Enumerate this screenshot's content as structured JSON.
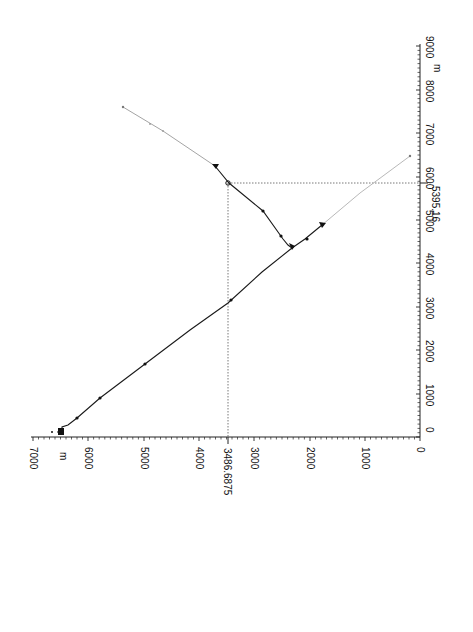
{
  "chart_data": {
    "type": "line",
    "title": "",
    "orientation": "rotated 90° (page in landscape); horizontal axis at bottom shows Y values decreasing left→right, vertical axis at right shows X values increasing upward",
    "xlabel": "m",
    "ylabel": "m",
    "xlim": [
      0,
      9000
    ],
    "ylim": [
      0,
      7000
    ],
    "x_ticks": [
      0,
      1000,
      2000,
      3000,
      4000,
      5000,
      6000,
      7000,
      8000,
      9000
    ],
    "y_ticks": [
      0,
      1000,
      2000,
      3000,
      4000,
      5000,
      6000,
      7000
    ],
    "x_unit_label": "m",
    "y_unit_label": "m",
    "grid": false,
    "annotations": {
      "crosshair_x": "5395.16",
      "crosshair_y": "3486.6875"
    },
    "series": [
      {
        "name": "main-trace",
        "style": "solid-dark",
        "points": [
          [
            0,
            6550
          ],
          [
            100,
            6550
          ],
          [
            300,
            6250
          ],
          [
            700,
            5830
          ],
          [
            1500,
            5000
          ],
          [
            3000,
            3450
          ],
          [
            4200,
            2300
          ],
          [
            4500,
            2000
          ],
          [
            4650,
            1750
          ]
        ]
      },
      {
        "name": "branch-trace",
        "style": "solid-dark",
        "points": [
          [
            4300,
            2300
          ],
          [
            4450,
            2450
          ],
          [
            4950,
            2900
          ],
          [
            5395,
            3487
          ],
          [
            5700,
            3700
          ]
        ]
      },
      {
        "name": "extension-upper",
        "style": "light",
        "points": [
          [
            5700,
            3700
          ],
          [
            6500,
            4500
          ],
          [
            7300,
            5300
          ]
        ]
      },
      {
        "name": "extension-lower",
        "style": "light",
        "points": [
          [
            4650,
            1750
          ],
          [
            5500,
            1000
          ],
          [
            6300,
            100
          ]
        ]
      }
    ]
  },
  "axes": {
    "bottom": {
      "unit": "m",
      "ticks": [
        {
          "label": "7000",
          "px": 33
        },
        {
          "label": "6000",
          "px": 88
        },
        {
          "label": "5000",
          "px": 144
        },
        {
          "label": "4000",
          "px": 199
        },
        {
          "label": "3000",
          "px": 254
        },
        {
          "label": "2000",
          "px": 310
        },
        {
          "label": "1000",
          "px": 365
        },
        {
          "label": "0",
          "px": 420
        }
      ],
      "crosshair_label": "3486.6875"
    },
    "right": {
      "unit": "m",
      "ticks": [
        {
          "label": "0",
          "px": 437
        },
        {
          "label": "1000",
          "px": 394
        },
        {
          "label": "2000",
          "px": 350
        },
        {
          "label": "3000",
          "px": 307
        },
        {
          "label": "4000",
          "px": 263
        },
        {
          "label": "5000",
          "px": 220
        },
        {
          "label": "6000",
          "px": 177
        },
        {
          "label": "7000",
          "px": 133
        },
        {
          "label": "8000",
          "px": 90
        },
        {
          "label": "9000",
          "px": 46
        }
      ],
      "crosshair_label": "5395.16"
    }
  },
  "colors": {
    "axis": "#222222",
    "trace": "#1a1a1a",
    "light_trace": "#9a9a9a",
    "crosshair": "#555555",
    "background": "#ffffff"
  }
}
